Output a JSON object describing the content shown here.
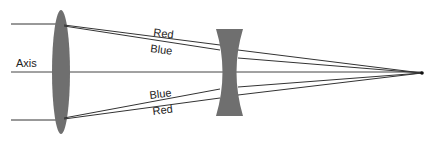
{
  "diagram": {
    "type": "optics-ray-diagram",
    "colors": {
      "background": "#ffffff",
      "lens_fill": "#6f6f6f",
      "ray_stroke": "#333333"
    },
    "labels": {
      "axis": "Axis",
      "top_outer": "Red",
      "top_inner": "Blue",
      "bottom_inner": "Blue",
      "bottom_outer": "Red"
    },
    "elements": [
      {
        "id": "converging-lens",
        "kind": "biconvex lens"
      },
      {
        "id": "diverging-lens",
        "kind": "biconcave lens"
      },
      {
        "id": "focal-point",
        "kind": "point"
      }
    ]
  }
}
